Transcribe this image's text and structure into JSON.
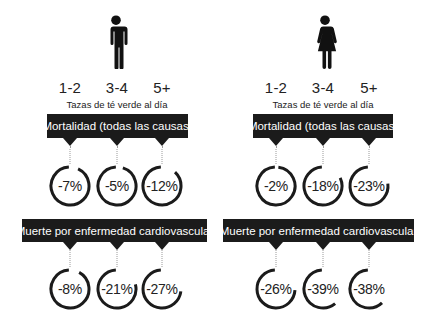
{
  "xlabel": "Tazas de té verde al día",
  "doses": [
    "1-2",
    "3-4",
    "5+"
  ],
  "panels": [
    {
      "gender": "Hombres",
      "icon": "man-icon",
      "sections": [
        {
          "title": "Mortalidad (todas las causas)",
          "values": [
            "-7%",
            "-5%",
            "-12%"
          ]
        },
        {
          "title": "Muerte por enfermedad cardiovascular",
          "values": [
            "-8%",
            "-21%",
            "-27%"
          ]
        }
      ]
    },
    {
      "gender": "Mujeres",
      "icon": "woman-icon",
      "sections": [
        {
          "title": "Mortalidad (todas las causas)",
          "values": [
            "-2%",
            "-18%",
            "-23%"
          ]
        },
        {
          "title": "Muerte por enfermedad cardiovascular",
          "values": [
            "-26%",
            "-39%",
            "-38%"
          ]
        }
      ]
    }
  ],
  "colors": {
    "banner": "#1b1b1b",
    "ring": "#1b1b1b",
    "text": "#222222",
    "background": "#ffffff"
  },
  "chart_data": {
    "type": "table",
    "title": "",
    "xlabel": "Tazas de té verde al día",
    "categories": [
      "1-2",
      "3-4",
      "5+"
    ],
    "groups": [
      {
        "name": "Hombres",
        "series": [
          {
            "name": "Mortalidad (todas las causas)",
            "values": [
              -7,
              -5,
              -12
            ]
          },
          {
            "name": "Muerte por enfermedad cardiovascular",
            "values": [
              -8,
              -21,
              -27
            ]
          }
        ]
      },
      {
        "name": "Mujeres",
        "series": [
          {
            "name": "Mortalidad (todas las causas)",
            "values": [
              -2,
              -18,
              -23
            ]
          },
          {
            "name": "Muerte por enfermedad cardiovascular",
            "values": [
              -26,
              -39,
              -38
            ]
          }
        ]
      }
    ],
    "unit": "%",
    "encoding": "ring gap from 12 o'clock clockwise proportional to percentage reduction"
  }
}
